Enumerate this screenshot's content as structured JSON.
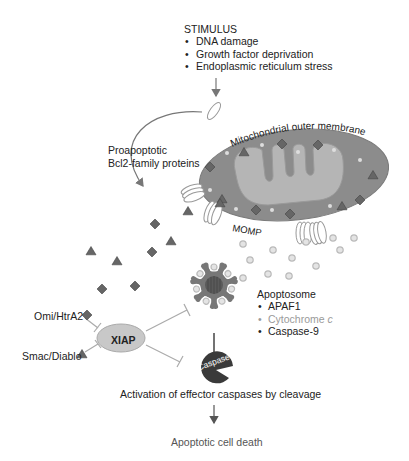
{
  "stimulus": {
    "title": "STIMULUS",
    "items": [
      "DNA damage",
      "Growth factor deprivation",
      "Endoplasmic reticulum stress"
    ]
  },
  "labels": {
    "bcl2_line1": "Proapoptotic",
    "bcl2_line2": "Bcl2-family proteins",
    "mito_membrane": "Mitochondrial outer membrane",
    "momp": "MOMP",
    "omi": "Omi/HtrA2",
    "smac": "Smac/Diablo",
    "xiap": "XIAP",
    "caspase": "Caspase",
    "activation": "Activation of effector caspases by cleavage",
    "death": "Apoptotic cell death"
  },
  "apoptosome": {
    "title": "Apoptosome",
    "items": [
      {
        "label": "APAF1",
        "style": "dark"
      },
      {
        "label": "Cytochrome c",
        "style": "light"
      },
      {
        "label": "Caspase-9",
        "style": "dark"
      }
    ]
  },
  "colors": {
    "mito_outer": "#8c8c8c",
    "mito_inner": "#b8b8b8",
    "marker_dark": "#555555",
    "arrow": "#777777",
    "inhibit_line": "#aaaaaa",
    "xiap_fill": "#c8c8c8",
    "caspase_fill": "#3a3a3a"
  }
}
